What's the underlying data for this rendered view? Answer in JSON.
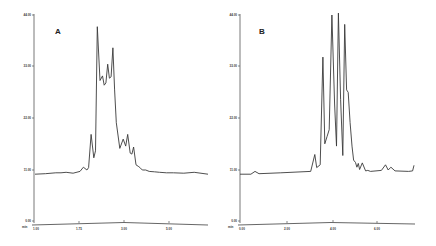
{
  "chart_data": [
    {
      "type": "line",
      "title": "A",
      "xlabel": "",
      "ylabel": "",
      "grid": false,
      "legend": "none",
      "y_ticks": [
        "0.00",
        "11.00",
        "22.00",
        "33.00",
        "44.00"
      ],
      "x_ticks": [
        "1.00",
        "1.75",
        "3.00",
        "5.00"
      ],
      "corner_label": "min",
      "ylim": [
        0,
        44
      ],
      "series": [
        {
          "name": "trace A",
          "x": [
            1.0,
            1.3,
            1.6,
            1.75,
            1.9,
            2.1,
            2.3,
            2.4,
            2.5,
            2.55,
            2.62,
            2.7,
            2.75,
            2.8,
            2.88,
            2.95,
            3.0,
            3.05,
            3.1,
            3.15,
            3.2,
            3.25,
            3.3,
            3.35,
            3.45,
            3.55,
            3.62,
            3.68,
            3.75,
            3.8,
            3.85,
            3.92,
            4.0,
            4.05,
            4.1,
            4.2,
            4.3,
            4.45,
            4.6,
            4.8,
            5.0,
            5.3,
            5.6,
            6.0
          ],
          "values": [
            10.0,
            10.1,
            10.3,
            10.3,
            10.4,
            10.2,
            10.6,
            11.5,
            10.9,
            11.4,
            18.5,
            13.5,
            15.0,
            41.5,
            30.0,
            31.0,
            29.0,
            29.5,
            33.5,
            30.5,
            30.8,
            37.0,
            28.0,
            21.0,
            15.5,
            17.5,
            16.0,
            18.5,
            14.5,
            14.3,
            15.8,
            12.0,
            11.6,
            11.3,
            10.9,
            10.9,
            10.6,
            10.5,
            10.4,
            10.3,
            10.3,
            10.2,
            10.4,
            10.0
          ]
        }
      ]
    },
    {
      "type": "line",
      "title": "B",
      "xlabel": "",
      "ylabel": "",
      "grid": false,
      "legend": "none",
      "y_ticks": [
        "0.00",
        "11.00",
        "22.00",
        "33.00",
        "44.00"
      ],
      "x_ticks": [
        "0.00",
        "2.00",
        "4.00",
        "6.00"
      ],
      "corner_label": "min",
      "ylim": [
        0,
        44
      ],
      "series": [
        {
          "name": "trace B",
          "x": [
            0.0,
            0.4,
            0.55,
            0.7,
            1.5,
            2.6,
            2.75,
            2.82,
            2.95,
            3.05,
            3.12,
            3.2,
            3.28,
            3.38,
            3.48,
            3.55,
            3.62,
            3.7,
            3.78,
            3.85,
            3.92,
            3.98,
            4.05,
            4.12,
            4.18,
            4.25,
            4.3,
            4.35,
            4.4,
            4.5,
            4.62,
            4.7,
            4.8,
            5.2,
            5.35,
            5.45,
            5.55,
            5.7,
            6.2,
            6.35,
            6.4
          ],
          "values": [
            10.0,
            10.0,
            10.6,
            10.1,
            10.3,
            10.6,
            14.2,
            11.4,
            12.0,
            35.0,
            16.5,
            18.0,
            19.5,
            44.0,
            25.0,
            16.0,
            44.4,
            26.0,
            14.0,
            42.0,
            28.0,
            27.5,
            21.0,
            16.0,
            13.0,
            12.5,
            11.5,
            12.3,
            11.0,
            12.4,
            10.7,
            10.8,
            10.6,
            10.8,
            12.0,
            10.9,
            11.5,
            10.7,
            10.6,
            10.7,
            11.9
          ]
        }
      ]
    }
  ],
  "panels": {
    "a": {
      "label": "A",
      "corner": "min",
      "y_ticks": [
        "0.00",
        "11.00",
        "22.00",
        "33.00",
        "44.00"
      ],
      "x_ticks": [
        "1.00",
        "1.75",
        "3.00",
        "5.00"
      ]
    },
    "b": {
      "label": "B",
      "corner": "min",
      "y_ticks": [
        "0.00",
        "11.00",
        "22.00",
        "33.00",
        "44.00"
      ],
      "x_ticks": [
        "0.00",
        "2.00",
        "4.00",
        "6.00"
      ]
    }
  },
  "colors": {
    "trace": "#3a3a3a",
    "axis": "#555555",
    "background": "#ffffff"
  }
}
